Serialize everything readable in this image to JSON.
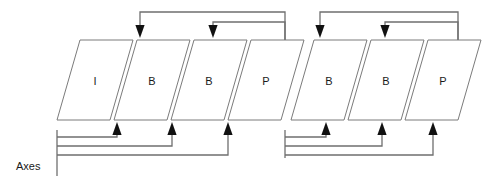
{
  "diagram": {
    "axes_label": "Axes",
    "colors": {
      "background": "#ffffff",
      "frame_stroke": "#7b7b7b",
      "frame_fill": "#ffffff",
      "line_stroke": "#6f6f6f",
      "arrow_fill": "#111111",
      "text": "#1a1a1a"
    },
    "frame_geometry": {
      "top_y": 40,
      "bottom_y": 120,
      "slant": 23,
      "width": 53,
      "label_dy": 2
    },
    "frames": [
      {
        "id": "frame-1",
        "label": "I",
        "x": 57,
        "type": "intra"
      },
      {
        "id": "frame-2",
        "label": "B",
        "x": 114,
        "type": "bidirectional"
      },
      {
        "id": "frame-3",
        "label": "B",
        "x": 171,
        "type": "bidirectional"
      },
      {
        "id": "frame-4",
        "label": "P",
        "x": 228,
        "type": "predicted"
      },
      {
        "id": "frame-5",
        "label": "B",
        "x": 291,
        "type": "bidirectional"
      },
      {
        "id": "frame-6",
        "label": "B",
        "x": 348,
        "type": "bidirectional"
      },
      {
        "id": "frame-7",
        "label": "P",
        "x": 405,
        "type": "predicted"
      }
    ],
    "forward_arrows": [
      {
        "id": "fwd-arrow-1",
        "x": 140,
        "tip_y": 38,
        "tail_y": 12,
        "source_x": 285,
        "rail_y": 12
      },
      {
        "id": "fwd-arrow-2",
        "x": 213,
        "tip_y": 38,
        "tail_y": 22,
        "source_x": 285,
        "rail_y": 22
      },
      {
        "id": "fwd-arrow-3",
        "x": 320,
        "tip_y": 38,
        "tail_y": 12,
        "source_x": 458,
        "rail_y": 12
      },
      {
        "id": "fwd-arrow-4",
        "x": 385,
        "tip_y": 38,
        "tail_y": 22,
        "source_x": 458,
        "rail_y": 22
      }
    ],
    "backward_arrows": [
      {
        "id": "back-arrow-1",
        "x": 117,
        "tip_y": 122,
        "rail_y": 137,
        "source_x": 57
      },
      {
        "id": "back-arrow-2",
        "x": 172,
        "tip_y": 122,
        "rail_y": 146,
        "source_x": 57
      },
      {
        "id": "back-arrow-3",
        "x": 228,
        "tip_y": 122,
        "rail_y": 155,
        "source_x": 57
      },
      {
        "id": "back-arrow-4",
        "x": 326,
        "tip_y": 122,
        "rail_y": 137,
        "source_x": 285
      },
      {
        "id": "back-arrow-5",
        "x": 382,
        "tip_y": 122,
        "rail_y": 146,
        "source_x": 285
      },
      {
        "id": "back-arrow-6",
        "x": 433,
        "tip_y": 122,
        "rail_y": 155,
        "source_x": 285
      }
    ],
    "axis_posts": [
      {
        "id": "axis-post-left",
        "x": 57,
        "y_top": 130,
        "y_bottom": 176
      },
      {
        "id": "axis-post-right",
        "x": 285,
        "y_top": 130,
        "y_bottom": 158
      }
    ],
    "axes_label_pos": {
      "x": 16,
      "y": 167
    },
    "arrow_head": {
      "half_width": 4.6,
      "length": 13
    }
  }
}
